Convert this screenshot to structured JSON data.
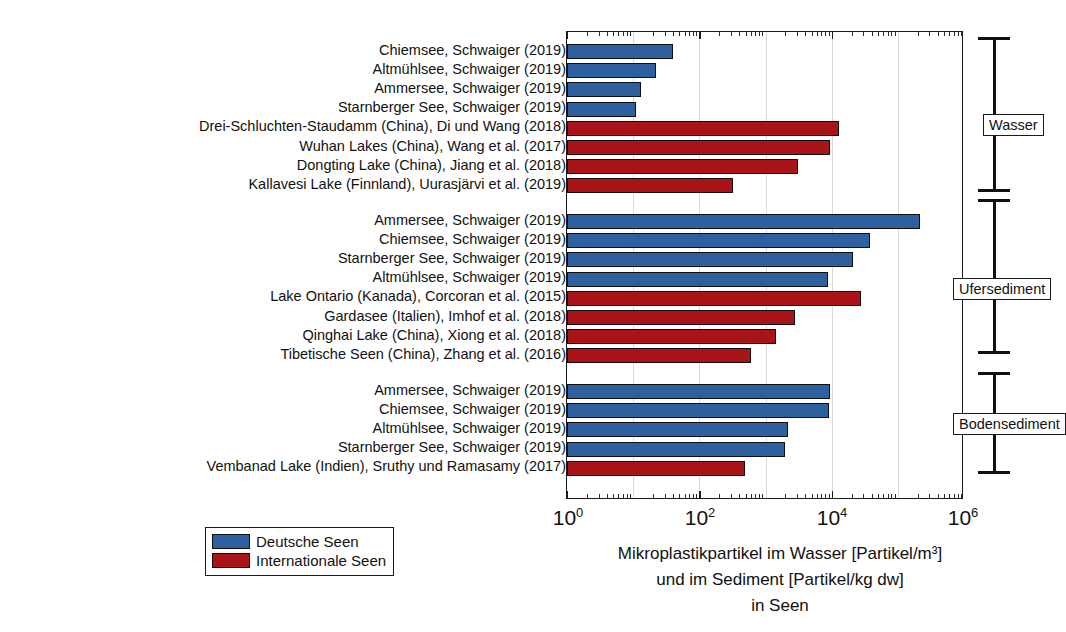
{
  "chart_data": {
    "type": "bar",
    "orientation": "horizontal",
    "title": "",
    "xlabel": "Mikroplastikpartikel im Wasser [Partikel/m³] und im Sediment [Partikel/kg dw] in Seen",
    "ylabel": "",
    "xscale": "log",
    "xlim": [
      1,
      1000000
    ],
    "xticks": [
      1,
      100,
      10000,
      1000000
    ],
    "xtick_labels": [
      "10⁰",
      "10²",
      "10⁴",
      "10⁶"
    ],
    "grid": true,
    "legend_position": "lower-left-outside",
    "legend": [
      {
        "name": "Deutsche Seen",
        "color": "#2e5f9e"
      },
      {
        "name": "Internationale Seen",
        "color": "#a81418"
      }
    ],
    "groups": [
      {
        "name": "Wasser",
        "categories": [
          "Chiemsee, Schwaiger (2019)",
          "Altmühlsee, Schwaiger (2019)",
          "Ammersee, Schwaiger (2019)",
          "Starnberger See, Schwaiger (2019)",
          "Drei-Schluchten-Staudamm (China), Di und Wang (2018)",
          "Wuhan Lakes (China), Wang et al. (2017)",
          "Dongting Lake (China), Jiang et al. (2018)",
          "Kallavesi Lake (Finnland), Uurasjärvi et al. (2019)"
        ],
        "values": [
          40,
          22,
          13,
          11,
          13000,
          9500,
          3100,
          320
        ],
        "series": [
          "Deutsche Seen",
          "Deutsche Seen",
          "Deutsche Seen",
          "Deutsche Seen",
          "Internationale Seen",
          "Internationale Seen",
          "Internationale Seen",
          "Internationale Seen"
        ]
      },
      {
        "name": "Ufersediment",
        "categories": [
          "Ammersee, Schwaiger (2019)",
          "Chiemsee, Schwaiger (2019)",
          "Starnberger See, Schwaiger (2019)",
          "Altmühlsee, Schwaiger (2019)",
          "Lake Ontario (Kanada), Corcoran et al. (2015)",
          "Gardasee (Italien), Imhof et al. (2018)",
          "Qinghai Lake (China), Xiong et al. (2018)",
          "Tibetische Seen (China), Zhang et al. (2016)"
        ],
        "values": [
          220000,
          38000,
          21000,
          8800,
          28000,
          2800,
          1450,
          610
        ],
        "series": [
          "Deutsche Seen",
          "Deutsche Seen",
          "Deutsche Seen",
          "Deutsche Seen",
          "Internationale Seen",
          "Internationale Seen",
          "Internationale Seen",
          "Internationale Seen"
        ]
      },
      {
        "name": "Bodensediment",
        "categories": [
          "Ammersee, Schwaiger (2019)",
          "Chiemsee, Schwaiger (2019)",
          "Altmühlsee, Schwaiger (2019)",
          "Starnberger See, Schwaiger (2019)",
          "Vembanad Lake (Indien), Sruthy und Ramasamy (2017)"
        ],
        "values": [
          9600,
          9000,
          2200,
          2000,
          490
        ],
        "series": [
          "Deutsche Seen",
          "Deutsche Seen",
          "Deutsche Seen",
          "Deutsche Seen",
          "Internationale Seen"
        ]
      }
    ]
  },
  "axis_title_lines": {
    "line1": "Mikroplastikpartikel im Wasser [Partikel/m³]",
    "line2": "und im Sediment [Partikel/kg dw]",
    "line3": "in Seen"
  },
  "xtick_labels": {
    "t0": "10",
    "t0sup": "0",
    "t2": "10",
    "t2sup": "2",
    "t4": "10",
    "t4sup": "4",
    "t6": "10",
    "t6sup": "6"
  },
  "legend": {
    "blue_label": "Deutsche Seen",
    "red_label": "Internationale Seen"
  },
  "brackets": {
    "wasser": "Wasser",
    "ufersediment": "Ufersediment",
    "bodensediment": "Bodensediment"
  }
}
